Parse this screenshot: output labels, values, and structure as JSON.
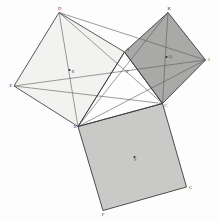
{
  "figure": {
    "background": "#fdfdfd"
  },
  "colors": {
    "square_left_fill": "#f2f2f0",
    "square_bottom_fill": "#c9c9c7",
    "square_right_fill": "#a9a9a7",
    "stroke": "#3c3c3c",
    "thin_stroke": "#5a5a5a",
    "label": "#3a3a3a",
    "dot": "#2e2e2e"
  },
  "triangle": {
    "name": "ABC",
    "vertices": [
      {
        "id": "A",
        "label": "A",
        "x": 124.5,
        "y": 52.0,
        "label_dx": 1.6,
        "label_dy": -1.4
      },
      {
        "id": "B",
        "label": "B",
        "x": 78.0,
        "y": 126.5,
        "label_dx": -4.4,
        "label_dy": 1.2
      },
      {
        "id": "C",
        "label": "C",
        "x": 162.5,
        "y": 103.5,
        "label_dx": 1.8,
        "label_dy": 3.2
      }
    ]
  },
  "squares": [
    {
      "id": "square-on-AB",
      "name": "left-square",
      "fill_key": "square_left_fill",
      "points": "124.5,52.0 59.0,12.5 14.0,86.0 78.0,126.5",
      "vertices": [
        {
          "id": "D",
          "label": "D",
          "x": 59.0,
          "y": 12.5,
          "label_dx": -1.0,
          "label_dy": -2.4
        },
        {
          "id": "E",
          "label": "E",
          "x": 14.0,
          "y": 86.0,
          "label_dx": -4.6,
          "label_dy": 0.6
        }
      ],
      "center": {
        "id": "R",
        "label": "R",
        "x": 69.5,
        "y": 70.0,
        "label_dx": 2.0,
        "label_dy": 3.0
      }
    },
    {
      "id": "square-on-BC",
      "name": "bottom-square",
      "fill_key": "square_bottom_fill",
      "points": "78.0,126.5 162.5,103.5 186.5,187.0 103.0,210.5",
      "vertices": [
        {
          "id": "G",
          "label": "G",
          "x": 186.5,
          "y": 187.0,
          "label_dx": 2.2,
          "label_dy": 1.6
        },
        {
          "id": "F",
          "label": "F",
          "x": 103.0,
          "y": 210.5,
          "label_dx": -1.2,
          "label_dy": 5.0
        }
      ],
      "center": {
        "id": "S",
        "label": "S",
        "x": 134.5,
        "y": 157.0,
        "label_dx": -0.4,
        "label_dy": 4.4
      }
    },
    {
      "id": "square-on-CA",
      "name": "right-square",
      "fill_key": "square_right_fill",
      "points": "124.5,52.0 168.0,12.5 205.5,60.0 162.5,103.5",
      "vertices": [
        {
          "id": "K",
          "label": "K",
          "x": 168.0,
          "y": 12.5,
          "label_dx": -0.4,
          "label_dy": -2.4
        },
        {
          "id": "J",
          "label": "J",
          "x": 205.5,
          "y": 60.0,
          "label_dx": 2.6,
          "label_dy": 1.4
        }
      ],
      "center": {
        "id": "Q",
        "label": "Q",
        "x": 166.5,
        "y": 57.0,
        "label_dx": 2.2,
        "label_dy": 1.0
      }
    }
  ],
  "cevians": [
    {
      "id": "cevian-D-C",
      "from": "D",
      "to": "C",
      "x1": 59.0,
      "y1": 12.5,
      "x2": 162.5,
      "y2": 103.5
    },
    {
      "id": "cevian-D-B",
      "from": "D",
      "to": "B",
      "x1": 59.0,
      "y1": 12.5,
      "x2": 78.0,
      "y2": 126.5
    },
    {
      "id": "cevian-E-J",
      "from": "E",
      "to": "J",
      "x1": 14.0,
      "y1": 86.0,
      "x2": 205.5,
      "y2": 60.0
    },
    {
      "id": "cevian-B-K",
      "from": "B",
      "to": "K",
      "x1": 78.0,
      "y1": 126.5,
      "x2": 168.0,
      "y2": 12.5
    },
    {
      "id": "cevian-B-J",
      "from": "B",
      "to": "J",
      "x1": 78.0,
      "y1": 126.5,
      "x2": 205.5,
      "y2": 60.0
    },
    {
      "id": "cevian-K-C",
      "from": "K",
      "to": "C",
      "x1": 168.0,
      "y1": 12.5,
      "x2": 162.5,
      "y2": 103.5
    },
    {
      "id": "cevian-D-J",
      "from": "D",
      "to": "J",
      "x1": 59.0,
      "y1": 12.5,
      "x2": 205.5,
      "y2": 60.0
    },
    {
      "id": "cevian-E-C",
      "from": "E",
      "to": "C",
      "x1": 14.0,
      "y1": 86.0,
      "x2": 162.5,
      "y2": 103.5
    }
  ],
  "interior_points": [
    {
      "id": "P",
      "label": "P",
      "x": 124.5,
      "y": 70.5,
      "label_dx": 1.8,
      "label_dy": 2.6
    }
  ]
}
